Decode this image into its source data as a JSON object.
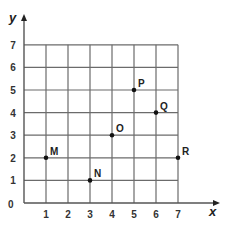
{
  "diagram": {
    "type": "coordinate-grid",
    "axes": {
      "x_label": "x",
      "y_label": "y",
      "origin_label": "0",
      "x_ticks": [
        "1",
        "2",
        "3",
        "4",
        "5",
        "6",
        "7"
      ],
      "y_ticks": [
        "1",
        "2",
        "3",
        "4",
        "5",
        "6",
        "7"
      ],
      "xlim": [
        0,
        7
      ],
      "ylim": [
        0,
        7
      ],
      "grid": true
    },
    "points": [
      {
        "label": "M",
        "x": 1,
        "y": 2
      },
      {
        "label": "N",
        "x": 3,
        "y": 1
      },
      {
        "label": "O",
        "x": 4,
        "y": 3
      },
      {
        "label": "P",
        "x": 5,
        "y": 5
      },
      {
        "label": "Q",
        "x": 6,
        "y": 4
      },
      {
        "label": "R",
        "x": 7,
        "y": 2
      }
    ],
    "colors": {
      "grid": "#6b6b6b",
      "axis": "#555555",
      "point": "#111111",
      "text": "#222222"
    }
  }
}
